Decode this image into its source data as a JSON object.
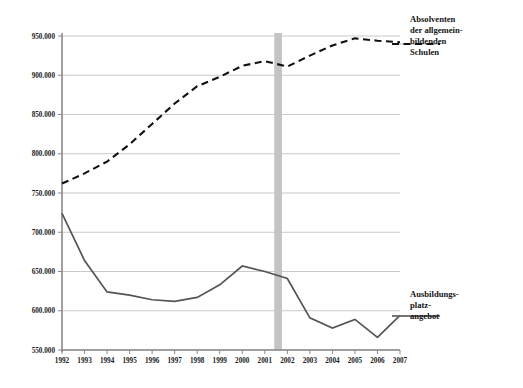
{
  "chart_data": {
    "type": "line",
    "title": "",
    "subtitle": "",
    "xlabel": "",
    "ylabel": "",
    "grid": true,
    "legend_position": "right",
    "ylim": [
      550000,
      950000
    ],
    "yticks": [
      550000,
      600000,
      650000,
      700000,
      750000,
      800000,
      850000,
      900000,
      950000
    ],
    "ytick_labels": [
      "550.000",
      "600.000",
      "650.000",
      "700.000",
      "750.000",
      "800.000",
      "850.000",
      "900.000",
      "950.000"
    ],
    "categories": [
      "1992",
      "1993",
      "1994",
      "1995",
      "1996",
      "1997",
      "1998",
      "1999",
      "2000",
      "2001",
      "2002",
      "2003",
      "2004",
      "2005",
      "2006",
      "2007"
    ],
    "series": [
      {
        "name": "Absolventen der allgemeinbildenden Schulen",
        "style": "dashed",
        "color": "#111111",
        "values": [
          762000,
          775000,
          790000,
          812000,
          838000,
          864000,
          886000,
          898000,
          912000,
          918000,
          911000,
          925000,
          938000,
          947000,
          944000,
          942000
        ]
      },
      {
        "name": "Ausbildungsplatzangebot",
        "style": "solid",
        "color": "#555555",
        "values": [
          724000,
          664000,
          624000,
          620000,
          614000,
          612000,
          617000,
          633000,
          657000,
          650000,
          641000,
          591000,
          578000,
          589000,
          566000,
          594000
        ]
      }
    ],
    "annotations": [
      {
        "id": "band",
        "type": "vertical-band",
        "from": "2001",
        "to": "2002",
        "color": "#c4c4c4"
      }
    ]
  },
  "labels": {
    "absolventen": "Absolventen der allgemein-bildenden Schulen",
    "absolventen_lines": [
      "Absolventen",
      "der allgemein-",
      "bildenden",
      "Schulen"
    ],
    "ausbildung": "Ausbildungs-platz-angebot",
    "ausbildung_lines": [
      "Ausbildungs-",
      "platz-",
      "angebot"
    ]
  },
  "caption": {
    "text": ""
  }
}
